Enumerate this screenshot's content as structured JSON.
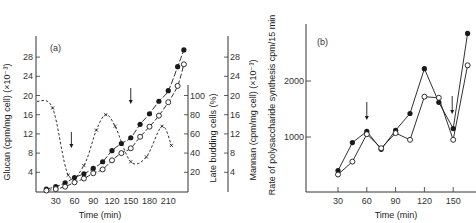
{
  "chart_data": [
    {
      "panel": "(a)",
      "type": "line",
      "xlabel": "Time (min)",
      "ylabel_left": "Glucan (cpm/mg cell) (×10⁻³)",
      "ylabel_right1": "Late budding cells (%)",
      "ylabel_right2": "Mannan (cpm/mg cell) (×10⁻³)",
      "x_ticks": [
        30,
        60,
        90,
        120,
        150,
        180,
        210
      ],
      "y_left_ticks": [
        4,
        8,
        12,
        16,
        20,
        24,
        28
      ],
      "y_right1_ticks": [
        20,
        40,
        60,
        80,
        100
      ],
      "y_right2_ticks": [
        4,
        8,
        12,
        16,
        20,
        24,
        28
      ],
      "arrows_at_x": [
        55,
        150
      ],
      "series": [
        {
          "name": "Glucan (filled circles)",
          "marker": "filled-circle",
          "axis": "left",
          "x": [
            15,
            30,
            45,
            60,
            75,
            90,
            105,
            120,
            135,
            150,
            165,
            180,
            195,
            210,
            225,
            235
          ],
          "y": [
            0.5,
            1.0,
            1.8,
            2.9,
            3.7,
            4.8,
            6.2,
            8.5,
            10.0,
            11.2,
            14.0,
            16.2,
            18.8,
            21.0,
            26.0,
            29.5
          ]
        },
        {
          "name": "Mannan (open circles)",
          "marker": "open-circle",
          "axis": "right2",
          "x": [
            15,
            30,
            45,
            60,
            75,
            90,
            105,
            120,
            135,
            150,
            165,
            180,
            195,
            210,
            225,
            235
          ],
          "y": [
            0.2,
            0.5,
            1.0,
            1.9,
            2.7,
            3.8,
            4.6,
            6.5,
            8.0,
            9.0,
            11.4,
            13.5,
            15.8,
            18.6,
            22.0,
            26.5
          ]
        },
        {
          "name": "Late budding cells (crosses, dashed)",
          "marker": "x",
          "axis": "right1",
          "x": [
            0,
            25,
            50,
            75,
            95,
            110,
            125,
            150,
            175,
            200,
            215
          ],
          "y": [
            94,
            87,
            17,
            27,
            64,
            80,
            68,
            31,
            36,
            68,
            48
          ]
        }
      ]
    },
    {
      "panel": "(b)",
      "type": "line",
      "xlabel": "Time (min)",
      "ylabel": "Rate of polysaccharide synthesis  cpm/15 min",
      "x_ticks": [
        30,
        60,
        90,
        120,
        150
      ],
      "y_ticks": [
        1000,
        2000
      ],
      "arrows_at_x": [
        60,
        150
      ],
      "series": [
        {
          "name": "filled circles",
          "marker": "filled-circle",
          "x": [
            30,
            45,
            60,
            75,
            90,
            105,
            120,
            135,
            150,
            165
          ],
          "y": [
            400,
            900,
            1100,
            780,
            1120,
            1420,
            2220,
            1620,
            1150,
            2850
          ]
        },
        {
          "name": "open circles",
          "marker": "open-circle",
          "x": [
            30,
            45,
            60,
            75,
            90,
            105,
            120,
            135,
            150,
            165
          ],
          "y": [
            330,
            560,
            1050,
            800,
            1070,
            950,
            1720,
            1700,
            950,
            2280
          ]
        }
      ]
    }
  ],
  "labels": {
    "panel_a": "(a)",
    "panel_b": "(b)",
    "xlabel_a": "Time (min)",
    "xlabel_b": "Time (min)",
    "ylabel_a_left": "Glucan (cpm/mg cell) (×10⁻³)",
    "ylabel_a_right1": "Late budding cells (%)",
    "ylabel_a_right2": "Mannan (cpm/mg cell) (×10⁻³)",
    "ylabel_b": "Rate of polysaccharide synthesis  cpm/15 min"
  },
  "colors": {
    "ink": "#1a1a1a",
    "axis": "#333333",
    "background": "#ffffff"
  }
}
